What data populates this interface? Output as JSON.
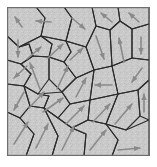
{
  "figure": {
    "title": "Polycrystalline grain structure with grain orientation arrows",
    "type": "diagram",
    "width": 157,
    "height": 167,
    "background_color": "#ffffff"
  },
  "panel": {
    "name": "microstructure-panel",
    "x": 7,
    "y": 7,
    "width": 143,
    "height": 149,
    "border_color": "#6e6e6e",
    "border_width": 1.2,
    "fill_color": "#c9c9c9"
  },
  "style": {
    "grain_fill": "#c9c9c9",
    "grain_boundary_color": "#2b2b2b",
    "grain_boundary_width": 1.1,
    "arrow_color": "#8a8a8a",
    "arrow_width": 1.6,
    "noise_color": "#b4b4b4",
    "noise_highlight": "#d8d8d8"
  },
  "chart_data": {
    "type": "diagram",
    "title": "Polycrystalline grain structure with grain orientation arrows",
    "grain_count": 30,
    "grains": [
      {
        "id": 1,
        "polygon": "7,7 7,36 19,47 41,36 45,18 36,7",
        "arrow": {
          "x1": 22,
          "y1": 27,
          "x2": 15,
          "y2": 17,
          "angle_deg": 125
        }
      },
      {
        "id": 2,
        "polygon": "36,7 45,18 41,36 66,41 72,18 64,7",
        "arrow": {
          "x1": 51,
          "y1": 22,
          "x2": 36,
          "y2": 21,
          "angle_deg": 184
        }
      },
      {
        "id": 3,
        "polygon": "64,7 72,18 66,41 86,47 96,26 92,7",
        "arrow": {
          "x1": 72,
          "y1": 18,
          "x2": 85,
          "y2": 29,
          "angle_deg": -40
        }
      },
      {
        "id": 4,
        "polygon": "92,7 96,26 110,30 120,21 118,7",
        "arrow": {
          "x1": 112,
          "y1": 22,
          "x2": 101,
          "y2": 13,
          "angle_deg": 140
        }
      },
      {
        "id": 5,
        "polygon": "118,7 120,21 132,29 149,24 149,7",
        "arrow": {
          "x1": 139,
          "y1": 22,
          "x2": 129,
          "y2": 13,
          "angle_deg": 138
        }
      },
      {
        "id": 6,
        "polygon": "7,36 7,60 21,64 33,56 29,44 19,47",
        "arrow": {
          "x1": 18,
          "y1": 40,
          "x2": 18,
          "y2": 57,
          "angle_deg": -90
        }
      },
      {
        "id": 7,
        "polygon": "19,47 29,44 33,56 49,57 52,44 41,36",
        "arrow": {
          "x1": 27,
          "y1": 59,
          "x2": 41,
          "y2": 47,
          "angle_deg": 45
        }
      },
      {
        "id": 8,
        "polygon": "41,36 52,44 49,57 64,62 71,52 66,41",
        "arrow": {
          "x1": 48,
          "y1": 58,
          "x2": 63,
          "y2": 44,
          "angle_deg": 43
        }
      },
      {
        "id": 9,
        "polygon": "66,41 71,52 64,62 76,78 94,70 86,47",
        "arrow": {
          "x1": 70,
          "y1": 60,
          "x2": 83,
          "y2": 48,
          "angle_deg": 42
        }
      },
      {
        "id": 10,
        "polygon": "86,47 94,70 112,66 110,30 96,26",
        "arrow": {
          "x1": 96,
          "y1": 36,
          "x2": 104,
          "y2": 59,
          "angle_deg": -71
        }
      },
      {
        "id": 11,
        "polygon": "110,30 112,66 132,58 132,29 120,21",
        "arrow": {
          "x1": 124,
          "y1": 62,
          "x2": 119,
          "y2": 38,
          "angle_deg": 102
        }
      },
      {
        "id": 12,
        "polygon": "132,29 132,58 149,60 149,24",
        "arrow": {
          "x1": 141,
          "y1": 37,
          "x2": 141,
          "y2": 54,
          "angle_deg": -90
        }
      },
      {
        "id": 13,
        "polygon": "7,60 7,84 24,86 31,74 21,64",
        "arrow": {
          "x1": 27,
          "y1": 66,
          "x2": 14,
          "y2": 78,
          "angle_deg": -137
        }
      },
      {
        "id": 14,
        "polygon": "21,64 31,74 24,86 38,94 49,79 49,57 33,56",
        "arrow": {
          "x1": 40,
          "y1": 89,
          "x2": 30,
          "y2": 63,
          "angle_deg": 111
        }
      },
      {
        "id": 15,
        "polygon": "49,57 49,79 62,92 76,78 64,62",
        "arrow": {
          "x1": 57,
          "y1": 89,
          "x2": 68,
          "y2": 66,
          "angle_deg": 64
        }
      },
      {
        "id": 16,
        "polygon": "76,78 62,92 70,104 90,100 94,70",
        "arrow": {
          "x1": 76,
          "y1": 97,
          "x2": 86,
          "y2": 78,
          "angle_deg": 62
        }
      },
      {
        "id": 17,
        "polygon": "94,70 90,100 118,94 112,66",
        "arrow": {
          "x1": 112,
          "y1": 85,
          "x2": 95,
          "y2": 85,
          "angle_deg": 180
        }
      },
      {
        "id": 18,
        "polygon": "112,66 118,94 138,90 149,80 149,60 132,58",
        "arrow": {
          "x1": 142,
          "y1": 68,
          "x2": 132,
          "y2": 82,
          "angle_deg": -55
        }
      },
      {
        "id": 19,
        "polygon": "7,84 7,112 20,118 30,106 24,86",
        "arrow": {
          "x1": 24,
          "y1": 92,
          "x2": 14,
          "y2": 110,
          "angle_deg": -118
        }
      },
      {
        "id": 20,
        "polygon": "24,86 30,106 44,108 49,96 38,94",
        "arrow": {
          "x1": 29,
          "y1": 108,
          "x2": 44,
          "y2": 92,
          "angle_deg": 47
        }
      },
      {
        "id": 21,
        "polygon": "38,94 49,96 44,108 58,118 70,104 62,92",
        "arrow": {
          "x1": 43,
          "y1": 112,
          "x2": 63,
          "y2": 98,
          "angle_deg": 35
        }
      },
      {
        "id": 22,
        "polygon": "70,104 58,118 72,128 88,120 90,100",
        "arrow": {
          "x1": 66,
          "y1": 124,
          "x2": 84,
          "y2": 106,
          "angle_deg": 45
        }
      },
      {
        "id": 23,
        "polygon": "90,100 88,120 106,124 118,94",
        "arrow": {
          "x1": 93,
          "y1": 122,
          "x2": 110,
          "y2": 104,
          "angle_deg": 46
        }
      },
      {
        "id": 24,
        "polygon": "118,94 106,124 126,130 140,116 138,90",
        "arrow": {
          "x1": 115,
          "y1": 124,
          "x2": 132,
          "y2": 104,
          "angle_deg": 50
        }
      },
      {
        "id": 25,
        "polygon": "138,90 140,116 149,120 149,80",
        "arrow": {
          "x1": 144,
          "y1": 112,
          "x2": 144,
          "y2": 94,
          "angle_deg": 90
        }
      },
      {
        "id": 26,
        "polygon": "7,112 7,156 26,156 34,134 20,118",
        "arrow": {
          "x1": 14,
          "y1": 144,
          "x2": 28,
          "y2": 122,
          "angle_deg": 58
        }
      },
      {
        "id": 27,
        "polygon": "20,118 34,134 26,156 52,156 58,136 44,108 30,106",
        "arrow": {
          "x1": 36,
          "y1": 148,
          "x2": 48,
          "y2": 124,
          "angle_deg": 63
        }
      },
      {
        "id": 28,
        "polygon": "44,108 58,136 52,156 84,156 86,134 72,128 58,118",
        "arrow": {
          "x1": 62,
          "y1": 150,
          "x2": 74,
          "y2": 126,
          "angle_deg": 63
        }
      },
      {
        "id": 29,
        "polygon": "72,128 86,134 84,156 112,156 118,140 106,124 88,120",
        "arrow": {
          "x1": 90,
          "y1": 150,
          "x2": 106,
          "y2": 130,
          "angle_deg": 52
        }
      },
      {
        "id": 30,
        "polygon": "106,124 118,140 112,156 149,156 149,120 126,130",
        "arrow": {
          "x1": 118,
          "y1": 150,
          "x2": 140,
          "y2": 148,
          "angle_deg": 5
        }
      }
    ],
    "arrow_legend": "Each arrow denotes the crystal lattice orientation of its grain"
  }
}
